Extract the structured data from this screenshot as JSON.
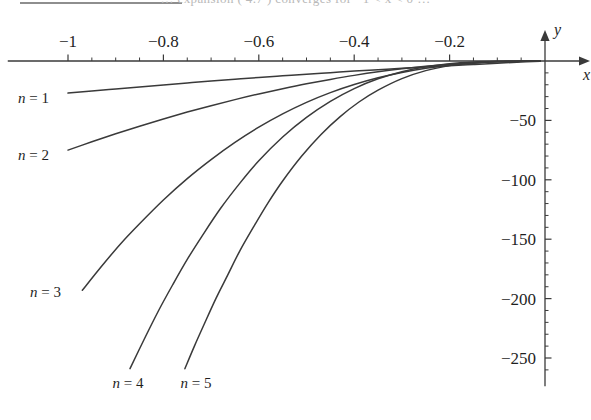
{
  "page": {
    "scan_artifact_text": "…  expansion  ( 4.7 )  converges  for  −1 < x < 0 …",
    "background": "#ffffff",
    "ink_color": "#3a3a3a"
  },
  "chart_data": {
    "type": "line",
    "title": "",
    "subtitle": "",
    "xlabel": "x",
    "ylabel": "y",
    "xlim": [
      -1.12,
      0.06
    ],
    "ylim": [
      -272,
      14
    ],
    "grid": false,
    "legend": "inline-curve-labels",
    "x_ticks_major": [
      -1,
      -0.8,
      -0.6,
      -0.4,
      -0.2
    ],
    "x_tick_labels": [
      "-1",
      "-0.8",
      "-0.6",
      "-0.4",
      "-0.2"
    ],
    "x_ticks_minor": [
      -0.95,
      -0.9,
      -0.85,
      -0.75,
      -0.7,
      -0.65,
      -0.55,
      -0.5,
      -0.45,
      -0.35,
      -0.3,
      -0.25,
      -0.15,
      -0.1,
      -0.05
    ],
    "y_ticks_major": [
      -50,
      -100,
      -150,
      -200,
      -250
    ],
    "y_tick_labels": [
      "-50",
      "-100",
      "-150",
      "-200",
      "-250"
    ],
    "y_ticks_minor": [
      -10,
      -20,
      -30,
      -40,
      -60,
      -70,
      -80,
      -90,
      -110,
      -120,
      -130,
      -140,
      -160,
      -170,
      -180,
      -190,
      -210,
      -220,
      -230,
      -240,
      -260
    ],
    "axis_arrows": true,
    "series": [
      {
        "name": "n = 1",
        "label": "n = 1",
        "x": [
          -1.0,
          -0.95,
          -0.9,
          -0.85,
          -0.8,
          -0.75,
          -0.7,
          -0.65,
          -0.6,
          -0.55,
          -0.5,
          -0.45,
          -0.4,
          -0.35,
          -0.3,
          -0.25,
          -0.2,
          -0.15,
          -0.1,
          -0.05,
          -0.01
        ],
        "values": [
          -27,
          -25.2,
          -23.5,
          -21.8,
          -20.1,
          -18.5,
          -16.9,
          -15.4,
          -13.9,
          -12.5,
          -11.1,
          -9.8,
          -8.5,
          -7.3,
          -6.1,
          -5.0,
          -3.9,
          -2.9,
          -1.9,
          -0.9,
          -0.2
        ]
      },
      {
        "name": "n = 2",
        "label": "n = 2",
        "x": [
          -1.0,
          -0.95,
          -0.9,
          -0.85,
          -0.8,
          -0.75,
          -0.7,
          -0.65,
          -0.6,
          -0.55,
          -0.5,
          -0.45,
          -0.4,
          -0.35,
          -0.3,
          -0.25,
          -0.2,
          -0.15,
          -0.1,
          -0.05,
          -0.01
        ],
        "values": [
          -75,
          -68,
          -61.3,
          -54.9,
          -48.8,
          -43.0,
          -37.6,
          -32.5,
          -27.7,
          -23.3,
          -19.2,
          -15.5,
          -12.1,
          -9.1,
          -6.6,
          -4.5,
          -2.8,
          -1.6,
          -0.7,
          -0.2,
          -0.01
        ]
      },
      {
        "name": "n = 3",
        "label": "n = 3",
        "x": [
          -0.97,
          -0.93,
          -0.89,
          -0.85,
          -0.8,
          -0.75,
          -0.7,
          -0.65,
          -0.6,
          -0.55,
          -0.5,
          -0.45,
          -0.4,
          -0.35,
          -0.3,
          -0.25,
          -0.2,
          -0.15,
          -0.1,
          -0.05,
          -0.01
        ],
        "values": [
          -193,
          -173,
          -154,
          -137,
          -117,
          -99,
          -83,
          -68.5,
          -55.7,
          -44.5,
          -34.8,
          -26.6,
          -19.8,
          -14.1,
          -9.6,
          -6.1,
          -3.5,
          -1.8,
          -0.7,
          -0.15,
          -0.005
        ]
      },
      {
        "name": "n = 4",
        "label": "n = 4",
        "x": [
          -0.87,
          -0.84,
          -0.81,
          -0.78,
          -0.75,
          -0.72,
          -0.68,
          -0.64,
          -0.6,
          -0.55,
          -0.5,
          -0.45,
          -0.4,
          -0.35,
          -0.3,
          -0.25,
          -0.2,
          -0.15,
          -0.1,
          -0.05,
          -0.01
        ],
        "values": [
          -259,
          -234,
          -210,
          -188,
          -167,
          -148,
          -124,
          -103,
          -84,
          -64,
          -47.5,
          -34.0,
          -23.2,
          -15.0,
          -9.0,
          -4.9,
          -2.3,
          -0.9,
          -0.25,
          -0.03,
          -0.001
        ]
      },
      {
        "name": "n = 5",
        "label": "n = 5",
        "x": [
          -0.755,
          -0.735,
          -0.715,
          -0.69,
          -0.665,
          -0.64,
          -0.61,
          -0.58,
          -0.55,
          -0.51,
          -0.47,
          -0.43,
          -0.39,
          -0.35,
          -0.3,
          -0.25,
          -0.2,
          -0.15,
          -0.1,
          -0.05,
          -0.01
        ],
        "values": [
          -259,
          -240,
          -222,
          -200,
          -180,
          -160,
          -139,
          -119,
          -101,
          -80,
          -62,
          -47,
          -34.5,
          -24.5,
          -14.8,
          -8.1,
          -3.9,
          -1.5,
          -0.4,
          -0.04,
          -0.001
        ]
      }
    ],
    "curve_label_positions": [
      {
        "label": "n = 1",
        "anchor": "left",
        "x_px": 18,
        "y_px": 103
      },
      {
        "label": "n = 2",
        "anchor": "left",
        "x_px": 18,
        "y_px": 160
      },
      {
        "label": "n = 3",
        "anchor": "left",
        "x_px": 30,
        "y_px": 297
      },
      {
        "label": "n = 4",
        "anchor": "center",
        "x_px": 128,
        "y_px": 388
      },
      {
        "label": "n = 5",
        "anchor": "center",
        "x_px": 196,
        "y_px": 388
      }
    ]
  }
}
